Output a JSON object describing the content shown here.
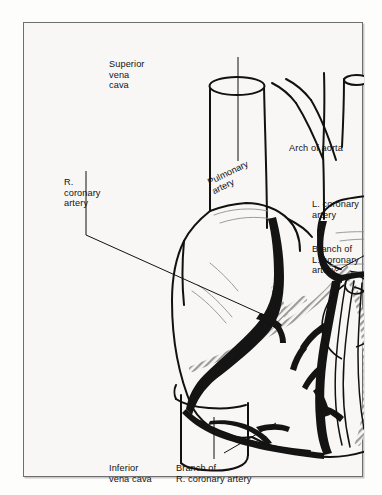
{
  "figure": {
    "type": "anatomical-diagram",
    "frame": {
      "border_color": "#6e6e70",
      "background_color": "#f8f7f5"
    },
    "ink_color": "#111111",
    "artery_fill": "#1b1b1b"
  },
  "labels": {
    "superior_vena_cava": {
      "lines": [
        "Superior",
        "vena",
        "cava"
      ],
      "text": "Superior\nvena\ncava"
    },
    "arch_of_aorta": {
      "lines": [
        "Arch of aorta"
      ],
      "text": "Arch of aorta"
    },
    "right_coronary_artery": {
      "lines": [
        "R.",
        "coronary",
        "artery"
      ],
      "text": "R.\ncoronary\nartery"
    },
    "left_coronary_artery": {
      "lines": [
        "L. coronary",
        "artery"
      ],
      "text": "L. coronary\nartery"
    },
    "branch_of_left_coronary_artery": {
      "lines": [
        "Branch of",
        "L. coronary",
        "artery"
      ],
      "text": "Branch of\nL. coronary\nartery"
    },
    "pulmonary_artery": {
      "lines": [
        "Pulmonary",
        "artery"
      ],
      "text": "Pulmonary\nartery"
    },
    "inferior_vena_cava": {
      "lines": [
        "Inferior",
        "vena cava"
      ],
      "text": "Inferior\nvena cava"
    },
    "branch_of_right_coronary_artery": {
      "lines": [
        "Branch of",
        "R. coronary artery"
      ],
      "text": "Branch of\nR. coronary artery"
    }
  },
  "structures": [
    {
      "name": "superior-vena-cava",
      "kind": "vessel-tube"
    },
    {
      "name": "inferior-vena-cava",
      "kind": "vessel-tube"
    },
    {
      "name": "aortic-arch",
      "kind": "great-vessel"
    },
    {
      "name": "brachiocephalic-trunk",
      "kind": "aortic-branch"
    },
    {
      "name": "left-common-carotid-artery",
      "kind": "aortic-branch"
    },
    {
      "name": "left-subclavian-artery",
      "kind": "aortic-branch"
    },
    {
      "name": "pulmonary-trunk",
      "kind": "great-vessel"
    },
    {
      "name": "right-coronary-artery",
      "kind": "coronary-artery"
    },
    {
      "name": "left-coronary-artery",
      "kind": "coronary-artery"
    },
    {
      "name": "branch-of-left-coronary-artery",
      "kind": "coronary-branch"
    },
    {
      "name": "branch-of-right-coronary-artery",
      "kind": "coronary-branch"
    },
    {
      "name": "coronary-sinus",
      "kind": "vein"
    },
    {
      "name": "right-ventricle",
      "kind": "chamber"
    },
    {
      "name": "left-ventricle",
      "kind": "chamber"
    },
    {
      "name": "right-atrium",
      "kind": "chamber"
    },
    {
      "name": "cardiac-apex",
      "kind": "landmark"
    }
  ]
}
